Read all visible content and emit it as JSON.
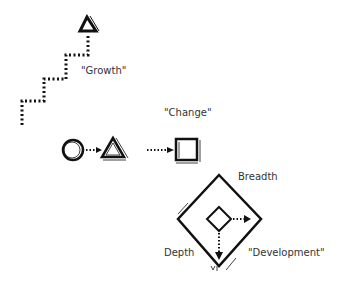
{
  "labels": {
    "growth": "\"Growth\"",
    "change": "\"Change\"",
    "breadth": "Breadth",
    "depth": "Depth",
    "development": "\"Development\""
  },
  "colors": {
    "ink": "#111111",
    "text": "#333333",
    "background": "#ffffff"
  }
}
